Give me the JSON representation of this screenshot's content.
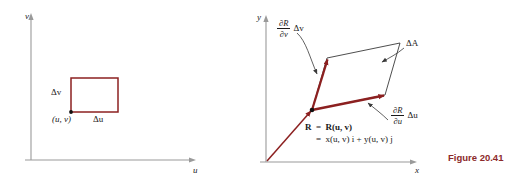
{
  "figure": {
    "caption": "Figure 20.41",
    "caption_color": "#8c2a2a",
    "curve_color": "#8c2020",
    "axis_color": "#9a9a9a",
    "outline_color": "#3a3a3a"
  },
  "left_panel": {
    "name": "uv-parameter-plane",
    "axes": {
      "x_label": "u",
      "y_label": "v"
    },
    "rectangle": {
      "corner_point_label": "(u, v)",
      "width_label": "Δu",
      "height_label": "Δv",
      "color": "#8c2020"
    }
  },
  "right_panel": {
    "name": "xy-image-plane",
    "axes": {
      "x_label": "x",
      "y_label": "y"
    },
    "area_label": "ΔA",
    "vector_v": {
      "numerator": "∂R",
      "denominator": "∂v",
      "tail": "Δv"
    },
    "vector_u": {
      "numerator": "∂R",
      "denominator": "∂u",
      "tail": "Δu"
    },
    "position_vector": {
      "line1_lhs": "R",
      "line1_rhs": "R(u, v)",
      "line2": "x(u, v) i + y(u, v) j"
    }
  }
}
